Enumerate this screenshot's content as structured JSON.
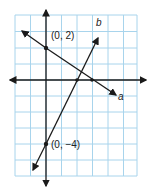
{
  "graph": {
    "points": [
      {
        "label": "(0, 2)",
        "x": 0,
        "y": 2
      },
      {
        "label": "(0, −4)",
        "x": 0,
        "y": -4
      }
    ],
    "lines": [
      {
        "name": "a",
        "label": "a",
        "y_intercept": 2,
        "slope": -0.667
      },
      {
        "name": "b",
        "label": "b",
        "y_intercept": -4,
        "slope": 2
      }
    ],
    "colors": {
      "grid": "#a8d4ec",
      "line": "#1a1a1a"
    }
  }
}
